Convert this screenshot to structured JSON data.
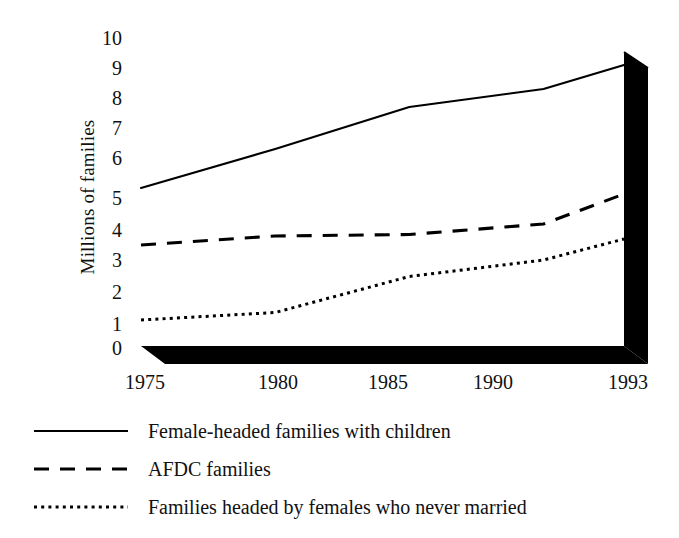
{
  "chart_data": {
    "type": "line",
    "title": "",
    "subtitle": "",
    "xlabel": "",
    "ylabel": "Millions of families",
    "x": [
      1975,
      1980,
      1985,
      1990,
      1993
    ],
    "xtick_labels": [
      "1975",
      "1980",
      "1985",
      "1990",
      "1993"
    ],
    "ytick_labels": [
      "0",
      "1",
      "2",
      "3",
      "4",
      "5",
      "6",
      "7",
      "8",
      "9",
      "10"
    ],
    "ylim": [
      0,
      10
    ],
    "xlim": [
      1975,
      1993
    ],
    "grid": false,
    "legend_position": "below",
    "style": "3d-base-and-wall",
    "series": [
      {
        "name": "Female-headed families with children",
        "linestyle": "solid",
        "color": "#000000",
        "values": [
          5.3,
          6.6,
          8.0,
          8.6,
          9.4
        ]
      },
      {
        "name": "AFDC families",
        "linestyle": "dashed",
        "color": "#000000",
        "values": [
          3.4,
          3.7,
          3.75,
          4.1,
          5.1
        ]
      },
      {
        "name": "Families headed by females who never married",
        "linestyle": "dotted",
        "color": "#000000",
        "values": [
          0.9,
          1.15,
          2.35,
          2.9,
          3.6
        ]
      }
    ]
  },
  "axis": {
    "y_label": "Millions of families",
    "y_ticks": [
      "10",
      "9",
      "8",
      "7",
      "6",
      "5",
      "4",
      "3",
      "2",
      "1",
      "0"
    ],
    "x_ticks": [
      "1975",
      "1980",
      "1985",
      "1990",
      "1993"
    ]
  },
  "legend": {
    "items": [
      {
        "label": "Female-headed families with children",
        "style": "solid"
      },
      {
        "label": "AFDC families",
        "style": "dashed"
      },
      {
        "label": "Families headed by females who never married",
        "style": "dotted"
      }
    ]
  },
  "colors": {
    "ink": "#111111",
    "line": "#000000",
    "base": "#000000",
    "background": "#ffffff"
  }
}
